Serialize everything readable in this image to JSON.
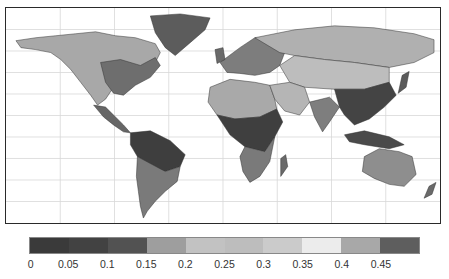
{
  "map": {
    "projection": "equirectangular world map",
    "frame_color": "#2a2a2a",
    "gridline_color": "#d8d8d8",
    "ocean_color": "#ffffff",
    "gridlines": {
      "vertical_count": 7,
      "horizontal_count": 9
    },
    "regions": [
      {
        "name": "greenland",
        "fill": "#5c5c5c"
      },
      {
        "name": "north-america",
        "fill": "#a8a8a8"
      },
      {
        "name": "north-america-east",
        "fill": "#6e6e6e"
      },
      {
        "name": "central-america",
        "fill": "#666666"
      },
      {
        "name": "south-america-amazon",
        "fill": "#3e3e3e"
      },
      {
        "name": "south-america-south",
        "fill": "#7a7a7a"
      },
      {
        "name": "europe",
        "fill": "#7d7d7d"
      },
      {
        "name": "russia-siberia",
        "fill": "#b0b0b0"
      },
      {
        "name": "central-asia",
        "fill": "#bdbdbd"
      },
      {
        "name": "sahara",
        "fill": "#a9a9a9"
      },
      {
        "name": "central-africa",
        "fill": "#3f3f3f"
      },
      {
        "name": "southern-africa",
        "fill": "#7a7a7a"
      },
      {
        "name": "middle-east",
        "fill": "#b5b5b5"
      },
      {
        "name": "india",
        "fill": "#7e7e7e"
      },
      {
        "name": "china-south-east-asia",
        "fill": "#444444"
      },
      {
        "name": "indonesia",
        "fill": "#4a4a4a"
      },
      {
        "name": "australia",
        "fill": "#8e8e8e"
      },
      {
        "name": "madagascar",
        "fill": "#6a6a6a"
      },
      {
        "name": "new-zealand",
        "fill": "#6a6a6a"
      },
      {
        "name": "japan",
        "fill": "#5a5a5a"
      },
      {
        "name": "uk",
        "fill": "#6a6a6a"
      }
    ]
  },
  "colorbar": {
    "segments": [
      {
        "from": 0,
        "to": 0.05,
        "color": "#3a3a3a"
      },
      {
        "from": 0.05,
        "to": 0.1,
        "color": "#424242"
      },
      {
        "from": 0.1,
        "to": 0.15,
        "color": "#525252"
      },
      {
        "from": 0.15,
        "to": 0.2,
        "color": "#9e9e9e"
      },
      {
        "from": 0.2,
        "to": 0.25,
        "color": "#c2c2c2"
      },
      {
        "from": 0.25,
        "to": 0.3,
        "color": "#bdbdbd"
      },
      {
        "from": 0.3,
        "to": 0.35,
        "color": "#cbcbcb"
      },
      {
        "from": 0.35,
        "to": 0.4,
        "color": "#ececec"
      },
      {
        "from": 0.4,
        "to": 0.45,
        "color": "#a8a8a8"
      },
      {
        "from": 0.45,
        "to": 0.5,
        "color": "#5e5e5e"
      }
    ],
    "tick_labels": [
      "0",
      "0.05",
      "0.1",
      "0.15",
      "0.2",
      "0.25",
      "0.3",
      "0.35",
      "0.4",
      "0.45"
    ]
  }
}
